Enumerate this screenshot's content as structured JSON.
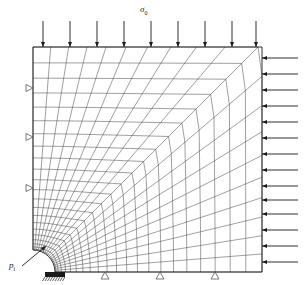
{
  "figure": {
    "title_label": "",
    "domain": {
      "x_left": 33,
      "x_right": 262,
      "y_top": 47,
      "y_bottom": 272,
      "hole_center_x": 33,
      "hole_center_y": 272,
      "hole_radius": 22,
      "outer_transition_radius": 150
    },
    "labels": {
      "far_field_stress": "σ",
      "far_field_stress_sub": "0",
      "internal_pressure": "p",
      "internal_pressure_sub": "i"
    },
    "loads": {
      "top_arrows": {
        "count": 9,
        "direction": "down",
        "length": 26,
        "x_positions": [
          43,
          70,
          97,
          124,
          151,
          178,
          205,
          232,
          256
        ],
        "tip_y": 47,
        "name": "far-field-compressive-stress-sigma-0"
      },
      "right_arrows": {
        "count": 14,
        "direction": "left",
        "length": 36,
        "y_positions": [
          58,
          74,
          90,
          106,
          122,
          138,
          154,
          170,
          186,
          200,
          214,
          230,
          246,
          262
        ],
        "tip_x": 262,
        "name": "lateral-compressive-stress"
      },
      "pressure_arrow": {
        "from_x": 22,
        "from_y": 266,
        "to_x": 46,
        "to_y": 246,
        "name": "internal-pressure-pointer"
      }
    },
    "supports": {
      "left_rollers": {
        "count": 3,
        "y_positions": [
          88,
          137,
          188
        ],
        "x": 33,
        "symbol": "roller-triangle-left",
        "name": "symmetry-roller-left-edge"
      },
      "bottom_rollers": {
        "count": 3,
        "x_positions": [
          105,
          160,
          215
        ],
        "y": 272,
        "symbol": "roller-triangle-up",
        "name": "symmetry-roller-bottom-edge"
      },
      "fixed_support": {
        "x": 55,
        "y": 272,
        "symbol": "hatched-fixed-support",
        "name": "fixed-support-hole-edge"
      }
    },
    "mesh": {
      "type": "quarter-plate-with-circular-hole",
      "radial_divisions": 22,
      "circumferential_divisions": 20,
      "stroke_color": "#1a1a1a",
      "stroke_width": 0.45,
      "border_width": 0.9
    }
  },
  "colors": {
    "ink": "#1a1a1a",
    "mesh": "#2b2b2b",
    "background": "#ffffff"
  }
}
